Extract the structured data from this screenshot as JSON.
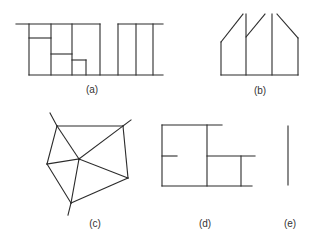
{
  "figure": {
    "stroke_color": "#2b2b2b",
    "background": "#ffffff",
    "panels": [
      {
        "id": "a",
        "label": "(a)",
        "label_pos": [
          92,
          89
        ],
        "description": "Rectangular partition: a block divided into sub-rectangles plus a separate block of three vertical strips, joined by a baseline",
        "segments": [
          [
            16,
            24,
            100,
            24
          ],
          [
            29,
            24,
            29,
            75
          ],
          [
            51,
            24,
            51,
            75
          ],
          [
            72,
            24,
            72,
            75
          ],
          [
            100,
            24,
            100,
            75
          ],
          [
            29,
            38,
            51,
            38
          ],
          [
            51,
            54,
            72,
            54
          ],
          [
            72,
            60,
            86,
            60
          ],
          [
            86,
            60,
            86,
            75
          ],
          [
            29,
            75,
            163,
            75
          ],
          [
            118,
            24,
            163,
            24
          ],
          [
            118,
            24,
            118,
            75
          ],
          [
            136,
            24,
            136,
            75
          ],
          [
            153,
            24,
            153,
            75
          ]
        ]
      },
      {
        "id": "b",
        "label": "(b)",
        "label_pos": [
          260,
          90
        ],
        "description": "Polygonal figure with slanted top edges and vertical dividers",
        "segments": [
          [
            221,
            75,
            298,
            75
          ],
          [
            221,
            42,
            221,
            75
          ],
          [
            221,
            42,
            243,
            14
          ],
          [
            246,
            14,
            246,
            75
          ],
          [
            246,
            37,
            265,
            14
          ],
          [
            272,
            14,
            272,
            75
          ],
          [
            277,
            14,
            298,
            38
          ],
          [
            298,
            38,
            298,
            75
          ]
        ]
      },
      {
        "id": "c",
        "label": "(c)",
        "label_pos": [
          95,
          223
        ],
        "description": "Pentagon triangulated from an interior center point, with three dangling external edges",
        "vertices": {
          "A": [
            57,
            126
          ],
          "B": [
            123,
            126
          ],
          "O": [
            79,
            159
          ],
          "C": [
            47,
            164
          ],
          "D": [
            128,
            178
          ],
          "E": [
            71,
            203
          ]
        },
        "segments": [
          [
            57,
            126,
            123,
            126
          ],
          [
            123,
            126,
            128,
            178
          ],
          [
            128,
            178,
            71,
            203
          ],
          [
            71,
            203,
            47,
            164
          ],
          [
            47,
            164,
            57,
            126
          ],
          [
            79,
            159,
            57,
            126
          ],
          [
            79,
            159,
            123,
            126
          ],
          [
            79,
            159,
            128,
            178
          ],
          [
            79,
            159,
            71,
            203
          ],
          [
            79,
            159,
            47,
            164
          ],
          [
            57,
            126,
            50,
            113
          ],
          [
            123,
            126,
            131,
            120
          ],
          [
            71,
            203,
            68,
            215
          ]
        ]
      },
      {
        "id": "d",
        "label": "(d)",
        "label_pos": [
          205,
          223
        ],
        "description": "Two adjoining rectangles with a short stub on the left and extending edges on the right",
        "segments": [
          [
            162,
            125,
            222,
            125
          ],
          [
            162,
            125,
            162,
            186
          ],
          [
            207,
            125,
            207,
            186
          ],
          [
            162,
            156,
            177,
            156
          ],
          [
            207,
            156,
            255,
            156
          ],
          [
            241,
            156,
            241,
            186
          ],
          [
            162,
            186,
            252,
            186
          ]
        ]
      },
      {
        "id": "e",
        "label": "(e)",
        "label_pos": [
          290,
          223
        ],
        "description": "Single vertical line segment",
        "segments": [
          [
            288,
            126,
            288,
            185
          ]
        ]
      }
    ]
  }
}
